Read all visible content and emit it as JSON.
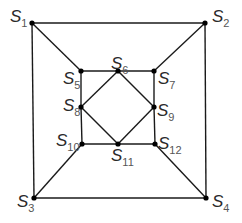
{
  "diagram": {
    "title": "",
    "nodes": [
      {
        "id": "S1",
        "letter": "S",
        "sub": "1",
        "x": 32,
        "y": 23,
        "label_x": 10,
        "label_y": 8
      },
      {
        "id": "S2",
        "letter": "S",
        "sub": "2",
        "x": 205,
        "y": 23,
        "label_x": 212,
        "label_y": 8
      },
      {
        "id": "S3",
        "letter": "S",
        "sub": "3",
        "x": 34,
        "y": 198,
        "label_x": 17,
        "label_y": 193
      },
      {
        "id": "S4",
        "letter": "S",
        "sub": "4",
        "x": 206,
        "y": 198,
        "label_x": 212,
        "label_y": 193
      },
      {
        "id": "S5",
        "letter": "S",
        "sub": "5",
        "x": 81,
        "y": 71,
        "label_x": 63,
        "label_y": 70
      },
      {
        "id": "S6",
        "letter": "S",
        "sub": "6",
        "x": 118,
        "y": 71,
        "label_x": 111,
        "label_y": 55
      },
      {
        "id": "S7",
        "letter": "S",
        "sub": "7",
        "x": 154,
        "y": 71,
        "label_x": 158,
        "label_y": 70
      },
      {
        "id": "S8",
        "letter": "S",
        "sub": "8",
        "x": 81,
        "y": 107,
        "label_x": 63,
        "label_y": 97
      },
      {
        "id": "S9",
        "letter": "S",
        "sub": "9",
        "x": 154,
        "y": 107,
        "label_x": 157,
        "label_y": 102
      },
      {
        "id": "S10",
        "letter": "S",
        "sub": "10",
        "x": 82,
        "y": 144,
        "label_x": 56,
        "label_y": 132
      },
      {
        "id": "S11",
        "letter": "S",
        "sub": "11",
        "x": 118,
        "y": 144,
        "label_x": 111,
        "label_y": 147
      },
      {
        "id": "S12",
        "letter": "S",
        "sub": "12",
        "x": 155,
        "y": 144,
        "label_x": 158,
        "label_y": 135
      }
    ],
    "edges": [
      [
        "S1",
        "S2"
      ],
      [
        "S2",
        "S4"
      ],
      [
        "S4",
        "S3"
      ],
      [
        "S3",
        "S1"
      ],
      [
        "S1",
        "S5"
      ],
      [
        "S2",
        "S7"
      ],
      [
        "S3",
        "S10"
      ],
      [
        "S4",
        "S12"
      ],
      [
        "S5",
        "S6"
      ],
      [
        "S6",
        "S7"
      ],
      [
        "S7",
        "S9"
      ],
      [
        "S9",
        "S12"
      ],
      [
        "S12",
        "S11"
      ],
      [
        "S11",
        "S10"
      ],
      [
        "S10",
        "S8"
      ],
      [
        "S8",
        "S5"
      ],
      [
        "S6",
        "S9"
      ],
      [
        "S9",
        "S11"
      ],
      [
        "S11",
        "S8"
      ],
      [
        "S8",
        "S6"
      ]
    ],
    "colors": {
      "edge": "#1a1a1a",
      "node": "#000000",
      "label": "#2a2a2a",
      "background": "#ffffff"
    }
  }
}
